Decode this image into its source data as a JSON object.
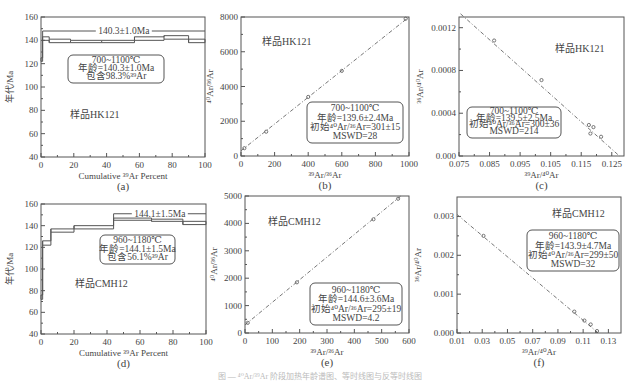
{
  "chart_data": [
    {
      "id": "a",
      "type": "line",
      "subtype": "step-age-spectrum",
      "panel_label": "(a)",
      "xlabel": "Cumulative ³⁹Ar Percent",
      "ylabel": "年代/Ma",
      "xlim": [
        0,
        100
      ],
      "ylim": [
        40,
        160
      ],
      "xticks": [
        0,
        20,
        40,
        60,
        80,
        100
      ],
      "yticks": [
        40,
        60,
        80,
        100,
        120,
        140,
        160
      ],
      "sample_label": "样品HK121",
      "plateau_label": "140.3±1.0Ma",
      "plateau_range": [
        1,
        100
      ],
      "plateau_y": 148,
      "steps": [
        {
          "x0": 0,
          "x1": 1,
          "lo": 122,
          "hi": 125
        },
        {
          "x0": 1,
          "x1": 5,
          "lo": 140,
          "hi": 143
        },
        {
          "x0": 5,
          "x1": 18,
          "lo": 138,
          "hi": 141
        },
        {
          "x0": 18,
          "x1": 37,
          "lo": 138,
          "hi": 140
        },
        {
          "x0": 37,
          "x1": 57,
          "lo": 138,
          "hi": 140
        },
        {
          "x0": 57,
          "x1": 75,
          "lo": 140,
          "hi": 143
        },
        {
          "x0": 75,
          "x1": 90,
          "lo": 141,
          "hi": 144
        },
        {
          "x0": 90,
          "x1": 100,
          "lo": 138,
          "hi": 141
        }
      ],
      "annotation": [
        "700~1100℃",
        "年龄=140.3±1.0Ma",
        "包含98.3%³⁹Ar"
      ]
    },
    {
      "id": "b",
      "type": "scatter",
      "subtype": "isochron",
      "panel_label": "(b)",
      "xlabel": "³⁹Ar/³⁶Ar",
      "ylabel": "⁴⁰Ar/³⁶Ar",
      "xlim": [
        0,
        1000
      ],
      "ylim": [
        0,
        8000
      ],
      "xticks": [
        0,
        200,
        400,
        600,
        800,
        1000
      ],
      "yticks": [
        0,
        2000,
        4000,
        6000,
        8000
      ],
      "sample_label": "样品HK121",
      "fit_line": {
        "x": [
          0,
          1000
        ],
        "y": [
          301,
          8000
        ]
      },
      "points": {
        "x": [
          20,
          150,
          400,
          600,
          980
        ],
        "y": [
          450,
          1400,
          3400,
          4900,
          7900
        ]
      },
      "annotation": [
        "700~1100℃",
        "年龄=139.6±2.4Ma",
        "初始⁴⁰Ar/³⁶Ar=301±15",
        "MSWD=28"
      ]
    },
    {
      "id": "c",
      "type": "scatter",
      "subtype": "inverse-isochron",
      "panel_label": "(c)",
      "xlabel": "³⁹Ar/⁴⁰Ar",
      "ylabel": "³⁶Ar/⁴⁰Ar",
      "xlim": [
        0.075,
        0.129
      ],
      "ylim": [
        0,
        0.0013
      ],
      "xticks": [
        0.075,
        0.085,
        0.095,
        0.105,
        0.115,
        0.125
      ],
      "xtick_labels": [
        "0.075",
        "0.085",
        "0.095",
        "0.105",
        "0.115",
        "0.125"
      ],
      "yticks": [
        0,
        0.0004,
        0.0008,
        0.0012
      ],
      "ytick_labels": [
        "0.000",
        "0.0004",
        "0.0008",
        "0.0012"
      ],
      "sample_label": "样品HK121",
      "fit_line": {
        "x": [
          0.0755,
          0.1275
        ],
        "y": [
          0.00133,
          0.0
        ]
      },
      "points": {
        "x": [
          0.0865,
          0.102,
          0.1175,
          0.119,
          0.118,
          0.1215
        ],
        "y": [
          0.00108,
          0.00071,
          0.00029,
          0.00027,
          0.00021,
          0.00018
        ]
      },
      "annotation": [
        "700~1100℃",
        "年龄=139.5±2.5Ma",
        "初始⁴⁰Ar/³⁶Ar=300±36",
        "MSWD=214"
      ]
    },
    {
      "id": "d",
      "type": "line",
      "subtype": "step-age-spectrum",
      "panel_label": "(d)",
      "xlabel": "Cumulative ³⁹Ar Percent",
      "ylabel": "年代/Ma",
      "xlim": [
        0,
        100
      ],
      "ylim": [
        40,
        160
      ],
      "xticks": [
        0,
        20,
        40,
        60,
        80,
        100
      ],
      "yticks": [
        40,
        60,
        80,
        100,
        120,
        140,
        160
      ],
      "sample_label": "样品CMH12",
      "plateau_label": "144.1±1.5Ma",
      "plateau_range": [
        44,
        100
      ],
      "plateau_y": 151,
      "steps": [
        {
          "x0": 0,
          "x1": 1,
          "lo": 72,
          "hi": 76
        },
        {
          "x0": 1,
          "x1": 6,
          "lo": 122,
          "hi": 126
        },
        {
          "x0": 6,
          "x1": 20,
          "lo": 134,
          "hi": 137
        },
        {
          "x0": 20,
          "x1": 44,
          "lo": 137,
          "hi": 140
        },
        {
          "x0": 44,
          "x1": 67,
          "lo": 145,
          "hi": 147
        },
        {
          "x0": 67,
          "x1": 86,
          "lo": 144,
          "hi": 146
        },
        {
          "x0": 86,
          "x1": 100,
          "lo": 141,
          "hi": 144
        }
      ],
      "annotation": [
        "960~1180℃",
        "年龄=144.1±1.5Ma",
        "包含56.1%³⁹Ar"
      ]
    },
    {
      "id": "e",
      "type": "scatter",
      "subtype": "isochron",
      "panel_label": "(e)",
      "xlabel": "³⁹Ar/³⁶Ar",
      "ylabel": "⁴⁰Ar/³⁶Ar",
      "xlim": [
        0,
        600
      ],
      "ylim": [
        0,
        5000
      ],
      "xticks": [
        0,
        100,
        200,
        300,
        400,
        500,
        600
      ],
      "yticks": [
        0,
        1000,
        2000,
        3000,
        4000,
        5000
      ],
      "sample_label": "样品CMH12",
      "fit_line": {
        "x": [
          0,
          570
        ],
        "y": [
          295,
          5000
        ]
      },
      "points": {
        "x": [
          10,
          190,
          470,
          560
        ],
        "y": [
          370,
          1850,
          4150,
          4900
        ]
      },
      "annotation": [
        "960~1180℃",
        "年龄=144.6±3.6Ma",
        "初始⁴⁰Ar/³⁶Ar=295±19",
        "MSWD=4.2"
      ]
    },
    {
      "id": "f",
      "type": "scatter",
      "subtype": "inverse-isochron",
      "panel_label": "(f)",
      "xlabel": "³⁹Ar/⁴⁰Ar",
      "ylabel": "³⁶Ar/⁴⁰Ar",
      "xlim": [
        0.01,
        0.14
      ],
      "ylim": [
        0,
        0.0035
      ],
      "xticks": [
        0.01,
        0.03,
        0.05,
        0.07,
        0.09,
        0.11,
        0.13
      ],
      "xtick_labels": [
        "0.01",
        "0.03",
        "0.05",
        "0.07",
        "0.09",
        "0.11",
        "0.13"
      ],
      "yticks": [
        0,
        0.001,
        0.002,
        0.003
      ],
      "ytick_labels": [
        "0.000",
        "0.001",
        "0.002",
        "0.003"
      ],
      "sample_label": "样品CMH12",
      "fit_line": {
        "x": [
          0.01,
          0.122
        ],
        "y": [
          0.00305,
          0.0
        ]
      },
      "points": {
        "x": [
          0.031,
          0.103,
          0.111,
          0.116,
          0.121
        ],
        "y": [
          0.0025,
          0.00055,
          0.00032,
          0.00022,
          5e-05
        ]
      },
      "annotation": [
        "960~1180℃",
        "年龄=143.9±4.7Ma",
        "初始⁴⁰Ar/³⁶Ar=299±50",
        "MSWD=32"
      ]
    }
  ],
  "layout": {
    "panels": {
      "a": {
        "left": 41,
        "top": 17,
        "right": 205,
        "bottom": 157,
        "box": [
          68,
          55,
          96,
          28,
          0
        ],
        "sample_pos": [
          70,
          118
        ]
      },
      "b": {
        "left": 241,
        "top": 17,
        "right": 409,
        "bottom": 156,
        "box": [
          307,
          102,
          96,
          41,
          0
        ],
        "sample_pos": [
          262,
          45
        ]
      },
      "c": {
        "left": 459,
        "top": 17,
        "right": 624,
        "bottom": 156,
        "box": [
          467,
          107,
          94,
          31,
          0
        ],
        "sample_pos": [
          555,
          52
        ]
      },
      "d": {
        "left": 41,
        "top": 204,
        "right": 206,
        "bottom": 334,
        "box": [
          100,
          235,
          75,
          29,
          0
        ],
        "sample_pos": [
          75,
          287
        ]
      },
      "e": {
        "left": 245,
        "top": 196,
        "right": 409,
        "bottom": 333,
        "box": [
          310,
          283,
          92,
          42,
          0
        ],
        "sample_pos": [
          268,
          225
        ]
      },
      "f": {
        "left": 457,
        "top": 197,
        "right": 621,
        "bottom": 333,
        "box": [
          527,
          230,
          92,
          41,
          0
        ],
        "sample_pos": [
          552,
          217
        ]
      }
    },
    "line_color": "#555555",
    "fit_color": "#666666"
  },
  "caption": "图 — ⁴⁰Ar/³⁹Ar 阶段加热年龄谱图、等时线图与反等时线图"
}
